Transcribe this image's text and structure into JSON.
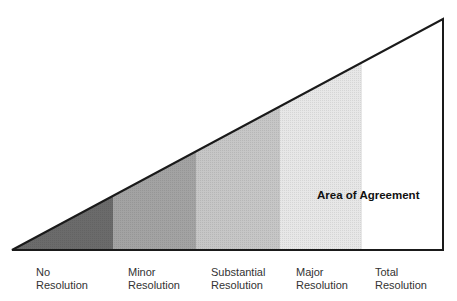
{
  "diagram": {
    "type": "wedge-continuum",
    "area_label": "Area of Agreement",
    "bands": [
      {
        "label_line1": "No",
        "label_line2": "Resolution",
        "color": "#6b6b6b"
      },
      {
        "label_line1": "Minor",
        "label_line2": "Resolution",
        "color": "#a3a3a3"
      },
      {
        "label_line1": "Substantial",
        "label_line2": "Resolution",
        "color": "#c6c6c6"
      },
      {
        "label_line1": "Major",
        "label_line2": "Resolution",
        "color": "#e7e7e7"
      },
      {
        "label_line1": "Total",
        "label_line2": "Resolution",
        "color": "#ffffff"
      }
    ],
    "outline_color": "#1a1a1a"
  }
}
